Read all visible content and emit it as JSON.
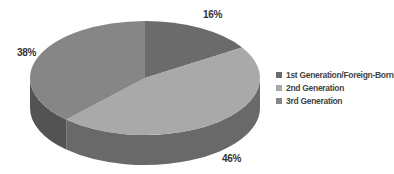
{
  "chart_data": {
    "type": "pie",
    "style": "3d",
    "title": "",
    "categories": [
      "1st Generation/Foreign-Born",
      "2nd Generation",
      "3rd Generation"
    ],
    "values": [
      16,
      46,
      38
    ],
    "labels": [
      "16%",
      "46%",
      "38%"
    ],
    "colors": [
      "#6b6b6b",
      "#a9a9a9",
      "#868686"
    ],
    "legend_position": "right"
  },
  "legend": {
    "items": [
      {
        "label": "1st Generation/Foreign-Born",
        "color": "#6b6b6b"
      },
      {
        "label": "2nd Generation",
        "color": "#a9a9a9"
      },
      {
        "label": "3rd Generation",
        "color": "#868686"
      }
    ]
  },
  "data_labels": {
    "first": "16%",
    "second": "46%",
    "third": "38%"
  }
}
